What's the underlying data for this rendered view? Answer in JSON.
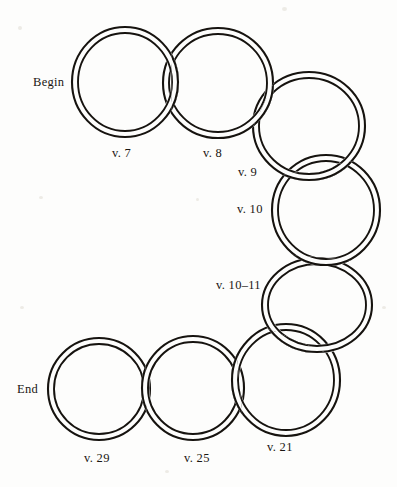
{
  "figure": {
    "background_color": "#fdfdfc",
    "ink_color": "#16130f",
    "width": 397,
    "height": 487
  },
  "chart_data": {
    "type": "diagram",
    "ring_count": 8,
    "rings": [
      {
        "id": "ring-1",
        "label": "v. 7",
        "cx": 125,
        "cy": 82,
        "rx": 53,
        "ry": 55,
        "tube": 6.0,
        "order": 1
      },
      {
        "id": "ring-2",
        "label": "v. 8",
        "cx": 218,
        "cy": 83,
        "rx": 55,
        "ry": 55,
        "tube": 6.0,
        "order": 2
      },
      {
        "id": "ring-3",
        "label": "v. 9",
        "cx": 309,
        "cy": 126,
        "rx": 56,
        "ry": 54,
        "tube": 6.0,
        "order": 3
      },
      {
        "id": "ring-4",
        "label": "v. 10",
        "cx": 326,
        "cy": 210,
        "rx": 54,
        "ry": 55,
        "tube": 6.0,
        "order": 4
      },
      {
        "id": "ring-5",
        "label": "v. 10–11",
        "cx": 317,
        "cy": 305,
        "rx": 55,
        "ry": 47,
        "tube": 6.0,
        "order": 5
      },
      {
        "id": "ring-6",
        "label": "v. 21",
        "cx": 286,
        "cy": 380,
        "rx": 54,
        "ry": 56,
        "tube": 6.0,
        "order": 6
      },
      {
        "id": "ring-7",
        "label": "v. 25",
        "cx": 193,
        "cy": 388,
        "rx": 51,
        "ry": 52,
        "tube": 6.0,
        "order": 7
      },
      {
        "id": "ring-8",
        "label": "v. 29",
        "cx": 99,
        "cy": 389,
        "rx": 51,
        "ry": 51,
        "tube": 6.0,
        "order": 8
      }
    ],
    "labels": [
      {
        "id": "label-begin",
        "text": "Begin",
        "x": 33,
        "y": 76,
        "anchor": "start"
      },
      {
        "id": "label-v7",
        "text": "v. 7",
        "x": 112,
        "y": 147,
        "anchor": "start"
      },
      {
        "id": "label-v8",
        "text": "v. 8",
        "x": 203,
        "y": 147,
        "anchor": "start"
      },
      {
        "id": "label-v9",
        "text": "v. 9",
        "x": 238,
        "y": 166,
        "anchor": "start"
      },
      {
        "id": "label-v10",
        "text": "v. 10",
        "x": 237,
        "y": 203,
        "anchor": "start"
      },
      {
        "id": "label-v10-11",
        "text": "v. 10–11",
        "x": 216,
        "y": 279,
        "anchor": "start"
      },
      {
        "id": "label-end",
        "text": "End",
        "x": 17,
        "y": 383,
        "anchor": "start"
      },
      {
        "id": "label-v29",
        "text": "v. 29",
        "x": 84,
        "y": 452,
        "anchor": "start"
      },
      {
        "id": "label-v25",
        "text": "v. 25",
        "x": 184,
        "y": 452,
        "anchor": "start"
      },
      {
        "id": "label-v21",
        "text": "v. 21",
        "x": 267,
        "y": 441,
        "anchor": "start"
      }
    ]
  }
}
